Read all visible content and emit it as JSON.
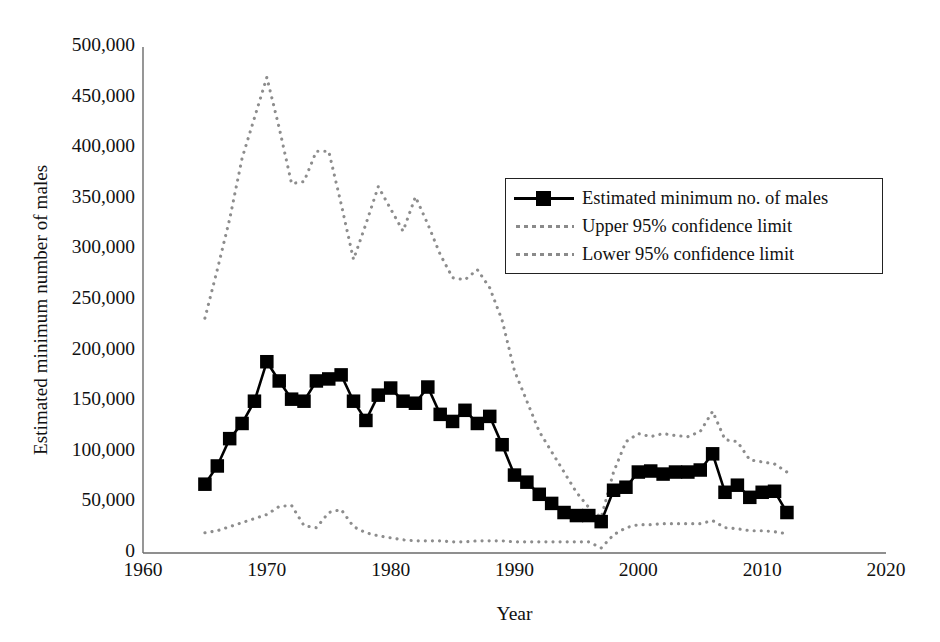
{
  "chart_data": {
    "type": "line",
    "title": "",
    "xlabel": "Year",
    "ylabel": "Estimated minimum number of males",
    "xlim": [
      1960,
      2020
    ],
    "ylim": [
      0,
      500000
    ],
    "xticks": [
      "1960",
      "1970",
      "1980",
      "1990",
      "2000",
      "2010",
      "2020"
    ],
    "xtick_values": [
      1960,
      1970,
      1980,
      1990,
      2000,
      2010,
      2020
    ],
    "yticks": [
      "0",
      "50,000",
      "100,000",
      "150,000",
      "200,000",
      "250,000",
      "300,000",
      "350,000",
      "400,000",
      "450,000",
      "500,000"
    ],
    "ytick_values": [
      0,
      50000,
      100000,
      150000,
      200000,
      250000,
      300000,
      350000,
      400000,
      450000,
      500000
    ],
    "grid": false,
    "legend_position": "upper-right",
    "legend": [
      {
        "label": "Estimated minimum no. of males",
        "style": "solid-square-marker",
        "color": "#000000"
      },
      {
        "label": "Upper 95% confidence limit",
        "style": "dotted",
        "color": "#8a8a8a"
      },
      {
        "label": "Lower 95% confidence limit",
        "style": "dotted",
        "color": "#8a8a8a"
      }
    ],
    "x": [
      1965,
      1966,
      1967,
      1968,
      1969,
      1970,
      1971,
      1972,
      1973,
      1974,
      1975,
      1976,
      1977,
      1978,
      1979,
      1980,
      1981,
      1982,
      1983,
      1984,
      1985,
      1986,
      1987,
      1988,
      1989,
      1990,
      1991,
      1992,
      1993,
      1994,
      1995,
      1996,
      1997,
      1998,
      1999,
      2000,
      2001,
      2002,
      2003,
      2004,
      2005,
      2006,
      2007,
      2008,
      2009,
      2010,
      2011,
      2012
    ],
    "series": [
      {
        "name": "Estimated minimum no. of males",
        "style": "solid-square-marker",
        "color": "#000000",
        "values": [
          68000,
          86000,
          113000,
          128000,
          150000,
          189000,
          170000,
          152000,
          150000,
          170000,
          172000,
          176000,
          150000,
          131000,
          156000,
          163000,
          150000,
          148000,
          164000,
          137000,
          130000,
          141000,
          128000,
          135000,
          107000,
          77000,
          70000,
          58000,
          49000,
          40000,
          37000,
          37000,
          31000,
          62000,
          65000,
          80000,
          81000,
          78000,
          80000,
          80000,
          82000,
          98000,
          60000,
          67000,
          55000,
          60000,
          61000,
          40000
        ]
      },
      {
        "name": "Upper 95% confidence limit",
        "style": "dotted",
        "color": "#8a8a8a",
        "values": [
          232000,
          280000,
          330000,
          390000,
          430000,
          470000,
          420000,
          365000,
          367000,
          397000,
          397000,
          345000,
          290000,
          325000,
          362000,
          340000,
          318000,
          352000,
          325000,
          295000,
          272000,
          270000,
          280000,
          262000,
          230000,
          180000,
          150000,
          120000,
          100000,
          80000,
          60000,
          45000,
          35000,
          80000,
          110000,
          118000,
          115000,
          118000,
          116000,
          115000,
          120000,
          140000,
          112000,
          110000,
          92000,
          90000,
          88000,
          80000
        ]
      },
      {
        "name": "Lower 95% confidence limit",
        "style": "dotted",
        "color": "#8a8a8a",
        "values": [
          20000,
          22000,
          26000,
          30000,
          34000,
          38000,
          46000,
          47000,
          27000,
          25000,
          40000,
          43000,
          26000,
          20000,
          17000,
          15000,
          13000,
          12000,
          12000,
          12000,
          11000,
          11000,
          12000,
          12000,
          12000,
          11000,
          11000,
          11000,
          11000,
          11000,
          11000,
          11000,
          5000,
          18000,
          25000,
          28000,
          28000,
          29000,
          29000,
          29000,
          29000,
          32000,
          25000,
          24000,
          22000,
          22000,
          21000,
          19000
        ]
      }
    ]
  }
}
